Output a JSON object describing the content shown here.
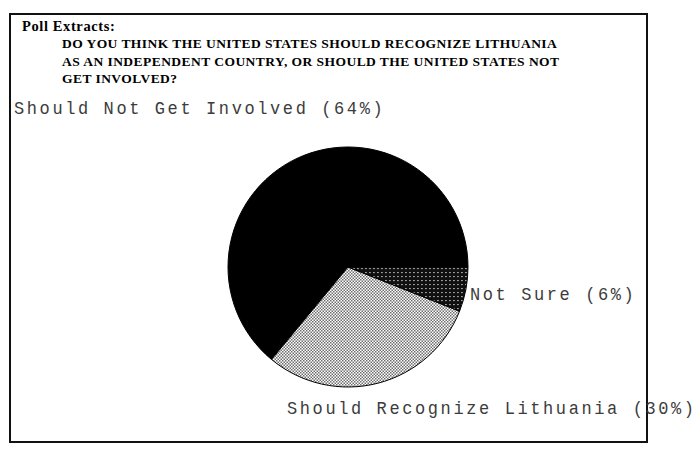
{
  "document": {
    "title_label": "Poll Extracts:",
    "question_lines": [
      "DO YOU THINK THE UNITED STATES SHOULD RECOGNIZE LITHUANIA",
      "AS AN INDEPENDENT COUNTRY, OR SHOULD THE UNITED STATES NOT",
      "GET INVOLVED?"
    ],
    "question_full": "DO YOU THINK THE UNITED STATES SHOULD RECOGNIZE LITHUANIA AS AN INDEPENDENT COUNTRY, OR SHOULD THE UNITED STATES NOT GET INVOLVED?"
  },
  "labels": {
    "should_not_get_involved": "Should Not Get Involved (64%)",
    "not_sure": "Not Sure (6%)",
    "should_recognize": "Should Recognize Lithuania (30%)"
  },
  "chart_data": {
    "type": "pie",
    "title": "DO YOU THINK THE UNITED STATES SHOULD RECOGNIZE LITHUANIA AS AN INDEPENDENT COUNTRY, OR SHOULD THE UNITED STATES NOT GET INVOLVED?",
    "xlabel": "",
    "ylabel": "",
    "legend_position": "callout-labels",
    "grid": false,
    "categories": [
      "Should Not Get Involved",
      "Should Recognize Lithuania",
      "Not Sure"
    ],
    "values": [
      64,
      30,
      6
    ],
    "value_unit": "percent",
    "slices": [
      {
        "name": "Should Not Get Involved",
        "value": 64,
        "label": "Should Not Get Involved (64%)",
        "fill": "solid-black",
        "color": "#000000",
        "start_angle_deg": 129.6,
        "end_angle_deg": 360.0,
        "label_position": "upper-left"
      },
      {
        "name": "Should Recognize Lithuania",
        "value": 30,
        "label": "Should Recognize Lithuania (30%)",
        "fill": "light-checker-dither",
        "color": "#b4b4b4",
        "start_angle_deg": 21.6,
        "end_angle_deg": 129.6,
        "label_position": "bottom"
      },
      {
        "name": "Not Sure",
        "value": 6,
        "label": "Not Sure (6%)",
        "fill": "dense-crosshatch",
        "color": "#4a4a4a",
        "start_angle_deg": 0.0,
        "end_angle_deg": 21.6,
        "label_position": "right"
      }
    ],
    "geometry": {
      "center_x": 348,
      "center_y": 267,
      "radius": 120
    }
  },
  "colors": {
    "frame": "#111111",
    "text": "#000000",
    "label_text": "#3c3c3c",
    "background": "#ffffff"
  }
}
